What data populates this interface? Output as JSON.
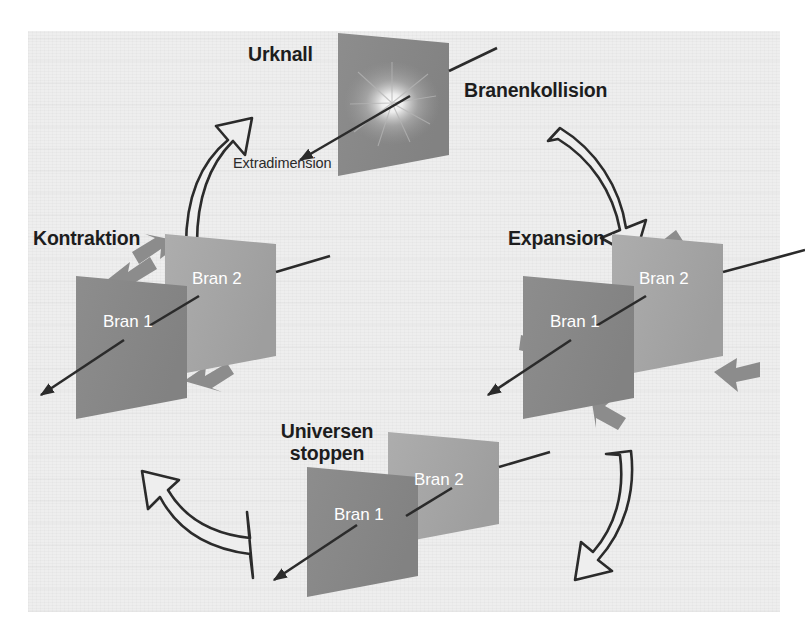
{
  "figure": {
    "title_urknall": "Urknall",
    "title_branenkollision": "Branenkollision",
    "title_expansion": "Expansion",
    "title_kontraktion": "Kontraktion",
    "title_universen_stoppen": "Universen\nstoppen",
    "label_extradimension": "Extradimension",
    "brane_labels": {
      "brane1": "Bran 1",
      "brane2": "Bran 2"
    },
    "colors": {
      "background": "#eeeeee",
      "page": "#ffffff",
      "brane_front": "#8a8a8a",
      "brane_back": "#a8a8a8",
      "brane_text": "#ffffff",
      "text": "#1d1d1d",
      "arrow_gray": "#8c8c8c",
      "arrow_outline": "#2b2b2b",
      "axis_line": "#2b2b2b",
      "burst": "#ffffff"
    },
    "stages": [
      {
        "name": "urknall",
        "label": "Urknall",
        "branes": 1,
        "arrows": "burst"
      },
      {
        "name": "expansion",
        "label": "Expansion",
        "branes": 2,
        "arrows": "outward"
      },
      {
        "name": "universen-stoppen",
        "label": "Universen stoppen",
        "branes": 2,
        "arrows": "none"
      },
      {
        "name": "kontraktion",
        "label": "Kontraktion",
        "branes": 2,
        "arrows": "inward"
      }
    ],
    "cycle_arrows": [
      {
        "name": "branenkollision-arrow",
        "from": "urknall",
        "to": "expansion"
      },
      {
        "name": "expansion-to-stoppen-arrow",
        "from": "expansion",
        "to": "universen-stoppen"
      },
      {
        "name": "stoppen-to-kontraktion-arrow",
        "from": "universen-stoppen",
        "to": "kontraktion"
      },
      {
        "name": "kontraktion-to-urknall-arrow",
        "from": "kontraktion",
        "to": "urknall"
      }
    ]
  }
}
